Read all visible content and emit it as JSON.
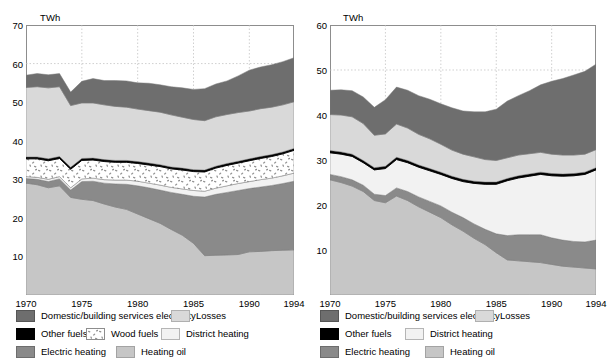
{
  "figure": {
    "panels": [
      {
        "id": "left",
        "unit": "TWh",
        "yaxis": {
          "min": 0,
          "max": 70,
          "ticks": [
            0,
            10,
            20,
            30,
            40,
            50,
            60,
            70
          ],
          "tick_labels": [
            "",
            "10",
            "20",
            "30",
            "40",
            "50",
            "60",
            "70"
          ]
        },
        "xaxis": {
          "min": 1970,
          "max": 1994,
          "ticks": [
            1970,
            1975,
            1980,
            1985,
            1990,
            1994
          ],
          "tick_labels": [
            "1970",
            "1975",
            "1980",
            "1985",
            "1990",
            "1994"
          ]
        },
        "legend": [
          [
            {
              "key": "domestic",
              "label": "Domestic/building services electricity"
            },
            {
              "key": "losses",
              "label": "Losses"
            }
          ],
          [
            {
              "key": "other",
              "label": "Other fuels"
            },
            {
              "key": "wood",
              "label": "Wood fuels"
            },
            {
              "key": "district",
              "label": "District heating"
            }
          ],
          [
            {
              "key": "electric",
              "label": "Electric heating"
            },
            {
              "key": "heatingoil",
              "label": "Heating oil"
            }
          ]
        ]
      },
      {
        "id": "right",
        "unit": "TWh",
        "yaxis": {
          "min": 0,
          "max": 60,
          "ticks": [
            0,
            10,
            20,
            30,
            40,
            50,
            60
          ],
          "tick_labels": [
            "",
            "10",
            "20",
            "30",
            "40",
            "50",
            "60"
          ]
        },
        "xaxis": {
          "min": 1970,
          "max": 1994,
          "ticks": [
            1970,
            1975,
            1980,
            1985,
            1990,
            1994
          ],
          "tick_labels": [
            "1970",
            "1975",
            "1980",
            "1985",
            "1990",
            "1994"
          ]
        },
        "legend": [
          [
            {
              "key": "domestic",
              "label": "Domestic/building services electricity"
            },
            {
              "key": "losses",
              "label": "Losses"
            }
          ],
          [
            {
              "key": "other",
              "label": "Other fuels"
            },
            {
              "key": "district",
              "label": "District heating"
            }
          ],
          [
            {
              "key": "electric",
              "label": "Electric heating"
            },
            {
              "key": "heatingoil",
              "label": "Heating oil"
            }
          ]
        ]
      }
    ]
  },
  "colors": {
    "domestic": "#6e6e6e",
    "losses": "#d9d9d9",
    "other": "#000000",
    "wood": "#ffffff",
    "district": "#f2f2f2",
    "electric": "#8a8a8a",
    "heatingoil": "#c6c6c6",
    "axis": "#8d8d8d",
    "grid": "#bbbbbb",
    "text": "#000000"
  },
  "chart_data": [
    {
      "type": "area",
      "stacked": true,
      "panel": "left",
      "title": "",
      "xlabel": "",
      "ylabel": "TWh",
      "ylim": [
        0,
        70
      ],
      "xlim": [
        1970,
        1994
      ],
      "grid": true,
      "legend_position": "below",
      "x": [
        1970,
        1971,
        1972,
        1973,
        1974,
        1975,
        1976,
        1977,
        1978,
        1979,
        1980,
        1981,
        1982,
        1983,
        1984,
        1985,
        1986,
        1987,
        1988,
        1989,
        1990,
        1991,
        1992,
        1993,
        1994
      ],
      "series": [
        {
          "name": "Heating oil",
          "key": "heatingoil",
          "values": [
            29.0,
            28.6,
            27.8,
            28.3,
            25.3,
            24.8,
            24.5,
            23.6,
            22.8,
            22.2,
            21.0,
            19.8,
            18.6,
            17.0,
            15.5,
            13.4,
            10.2,
            10.3,
            10.4,
            10.5,
            11.2,
            11.3,
            11.5,
            11.6,
            11.7
          ]
        },
        {
          "name": "Electric heating",
          "key": "electric",
          "values": [
            1.2,
            1.4,
            1.6,
            1.8,
            1.9,
            4.6,
            5.0,
            5.4,
            6.0,
            6.5,
            7.3,
            8.0,
            8.6,
            9.6,
            10.6,
            12.2,
            15.2,
            15.8,
            16.2,
            16.6,
            16.4,
            16.7,
            16.9,
            17.3,
            17.8
          ]
        },
        {
          "name": "District heating",
          "key": "district",
          "values": [
            0.5,
            0.5,
            0.6,
            0.6,
            0.6,
            0.7,
            0.8,
            0.9,
            1.0,
            1.1,
            1.2,
            1.2,
            1.3,
            1.3,
            1.4,
            1.5,
            1.5,
            1.6,
            1.7,
            1.8,
            1.8,
            1.9,
            1.9,
            2.0,
            2.1
          ]
        },
        {
          "name": "Wood fuels",
          "key": "wood",
          "values": [
            4.6,
            4.8,
            4.8,
            4.7,
            4.8,
            4.8,
            4.7,
            4.7,
            4.6,
            4.6,
            4.6,
            4.7,
            4.8,
            4.8,
            4.9,
            4.9,
            5.0,
            5.2,
            5.3,
            5.3,
            5.4,
            5.5,
            5.6,
            5.7,
            5.9
          ]
        },
        {
          "name": "Other fuels",
          "key": "other",
          "values": [
            0.5,
            0.5,
            0.5,
            0.5,
            0.5,
            0.5,
            0.5,
            0.5,
            0.5,
            0.5,
            0.5,
            0.5,
            0.5,
            0.5,
            0.5,
            0.5,
            0.5,
            0.5,
            0.5,
            0.5,
            0.5,
            0.5,
            0.5,
            0.5,
            0.5
          ]
        },
        {
          "name": "Losses",
          "key": "losses",
          "values": [
            18.0,
            18.2,
            18.4,
            18.1,
            16.0,
            14.4,
            14.3,
            14.2,
            14.0,
            13.8,
            13.6,
            13.6,
            13.6,
            13.5,
            13.2,
            13.0,
            12.8,
            12.8,
            12.7,
            12.6,
            12.4,
            12.4,
            12.3,
            12.2,
            12.1
          ]
        },
        {
          "name": "Domestic/building services electricity",
          "key": "domestic",
          "values": [
            3.2,
            3.4,
            3.4,
            3.4,
            3.5,
            5.6,
            6.3,
            6.3,
            6.7,
            6.8,
            6.8,
            7.1,
            7.1,
            7.3,
            7.6,
            7.8,
            8.3,
            8.5,
            8.7,
            9.5,
            10.6,
            10.8,
            11.0,
            11.2,
            11.4
          ]
        }
      ]
    },
    {
      "type": "area",
      "stacked": true,
      "panel": "right",
      "title": "",
      "xlabel": "",
      "ylabel": "TWh",
      "ylim": [
        0,
        60
      ],
      "xlim": [
        1970,
        1994
      ],
      "grid": true,
      "legend_position": "below",
      "x": [
        1970,
        1971,
        1972,
        1973,
        1974,
        1975,
        1976,
        1977,
        1978,
        1979,
        1980,
        1981,
        1982,
        1983,
        1984,
        1985,
        1986,
        1987,
        1988,
        1989,
        1990,
        1991,
        1992,
        1993,
        1994
      ],
      "series": [
        {
          "name": "Heating oil",
          "key": "heatingoil",
          "values": [
            25.6,
            25.0,
            24.2,
            23.0,
            21.0,
            20.5,
            22.0,
            21.0,
            19.6,
            18.4,
            17.2,
            15.6,
            14.2,
            12.6,
            11.2,
            9.4,
            7.8,
            7.6,
            7.4,
            7.2,
            6.8,
            6.4,
            6.2,
            6.0,
            5.8
          ]
        },
        {
          "name": "Electric heating",
          "key": "electric",
          "values": [
            1.2,
            1.3,
            1.4,
            1.4,
            1.4,
            1.6,
            1.8,
            2.0,
            2.2,
            2.4,
            2.6,
            2.8,
            3.0,
            3.2,
            3.4,
            4.2,
            5.4,
            5.8,
            6.0,
            6.2,
            5.9,
            5.8,
            5.7,
            5.8,
            6.4
          ]
        },
        {
          "name": "District heating",
          "key": "district",
          "values": [
            4.8,
            5.0,
            5.2,
            5.0,
            5.4,
            6.0,
            6.3,
            6.4,
            6.6,
            6.8,
            7.0,
            7.5,
            8.0,
            9.0,
            10.0,
            11.0,
            12.2,
            12.6,
            13.0,
            13.4,
            13.8,
            14.2,
            14.6,
            15.0,
            15.6
          ]
        },
        {
          "name": "Other fuels",
          "key": "other",
          "values": [
            0.5,
            0.5,
            0.5,
            0.5,
            0.5,
            0.5,
            0.5,
            0.5,
            0.5,
            0.5,
            0.5,
            0.5,
            0.5,
            0.5,
            0.5,
            0.5,
            0.5,
            0.5,
            0.5,
            0.5,
            0.5,
            0.5,
            0.5,
            0.5,
            0.5
          ]
        },
        {
          "name": "Losses",
          "key": "losses",
          "values": [
            8.0,
            8.2,
            8.3,
            8.2,
            7.2,
            7.2,
            7.4,
            7.2,
            6.8,
            6.6,
            6.2,
            5.8,
            5.6,
            5.4,
            5.0,
            4.8,
            4.6,
            4.6,
            4.5,
            4.4,
            4.3,
            4.2,
            4.1,
            4.0,
            4.0
          ]
        },
        {
          "name": "Domestic/building services electricity",
          "key": "domestic",
          "values": [
            5.4,
            5.6,
            5.8,
            5.9,
            6.2,
            7.6,
            8.2,
            8.4,
            8.6,
            8.8,
            9.0,
            9.4,
            9.6,
            10.0,
            10.6,
            11.4,
            12.6,
            13.2,
            14.0,
            15.0,
            16.2,
            17.0,
            17.8,
            18.4,
            19.0
          ]
        }
      ]
    }
  ]
}
